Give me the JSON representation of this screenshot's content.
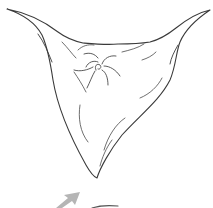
{
  "diagram": {
    "colors": {
      "background": "#ffffff",
      "outline": "#3a3a3a",
      "folds": "#4a4a4a",
      "arrow": "#b5b5b5",
      "bottom_line": "#555555"
    },
    "elements": [
      {
        "name": "cloth-outline"
      },
      {
        "name": "twist-center-swirl"
      },
      {
        "name": "fold-lines"
      },
      {
        "name": "direction-arrow"
      }
    ]
  }
}
